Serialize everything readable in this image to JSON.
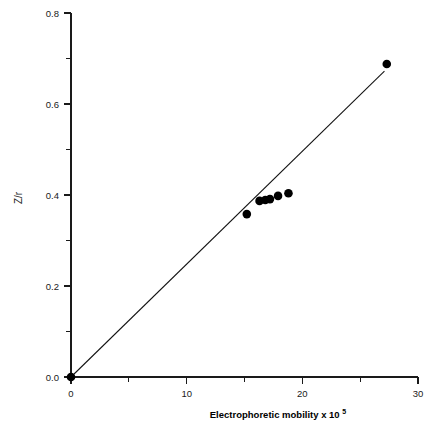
{
  "chart_data": {
    "type": "scatter",
    "title": "",
    "subtitle": "",
    "xlabel": "Electrophoretic mobility x 10",
    "xlabel_exponent": "5",
    "ylabel": "Z/r",
    "xlim": [
      0,
      30
    ],
    "ylim": [
      0.0,
      0.8
    ],
    "grid": false,
    "legend": null,
    "x_ticks": [
      0,
      10,
      20,
      30
    ],
    "x_tick_labels": [
      "0",
      "10",
      "20",
      "30"
    ],
    "x_minor_ticks": [
      5,
      15,
      25
    ],
    "y_ticks": [
      0.0,
      0.2,
      0.4,
      0.6,
      0.8
    ],
    "y_tick_labels": [
      "0.0",
      "0.2",
      "0.4",
      "0.6",
      "0.8"
    ],
    "y_minor_ticks": [
      0.1,
      0.3,
      0.5,
      0.7
    ],
    "marker": "filled-circle",
    "marker_color": "#000000",
    "line_color": "#111111",
    "points": [
      {
        "x": 0.0,
        "y": 0.0
      },
      {
        "x": 15.2,
        "y": 0.358
      },
      {
        "x": 16.3,
        "y": 0.387
      },
      {
        "x": 16.8,
        "y": 0.389
      },
      {
        "x": 17.2,
        "y": 0.391
      },
      {
        "x": 17.9,
        "y": 0.398
      },
      {
        "x": 18.8,
        "y": 0.404
      },
      {
        "x": 27.3,
        "y": 0.688
      }
    ],
    "fit_line": {
      "type": "linear",
      "from": {
        "x": 0.0,
        "y": 0.0
      },
      "to": {
        "x": 27.1,
        "y": 0.672
      },
      "slope": 0.0248,
      "intercept": 0.0
    }
  }
}
